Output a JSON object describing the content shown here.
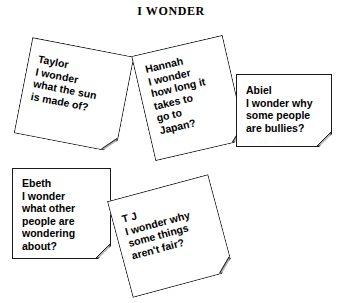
{
  "page": {
    "title": "I WONDER",
    "background_color": "#ffffff",
    "ink_color": "#000000",
    "note_border_color": "#1a1a1a",
    "fold_fill_color": "#b3b3b3"
  },
  "notes": [
    {
      "id": "taylor",
      "author": "Taylor",
      "lines": [
        "Taylor",
        "I wonder",
        "what the sun",
        "is made of?"
      ],
      "line_1": "Taylor",
      "line_2": "I wonder",
      "line_3": "what the sun",
      "line_4": "is made of?",
      "rotation_deg": 11
    },
    {
      "id": "hannah",
      "author": "Hannah",
      "lines": [
        "Hannah",
        "I wonder",
        "how long it",
        "takes to",
        "go to",
        "Japan?"
      ],
      "line_1": "Hannah",
      "line_2": "I wonder",
      "line_3": "how long it",
      "line_4": "takes to",
      "line_5": "go to",
      "line_6": "Japan?",
      "rotation_deg": -13
    },
    {
      "id": "abiel",
      "author": "Abiel",
      "lines": [
        "Abiel",
        "I wonder why",
        "some people",
        "are bullies?"
      ],
      "line_1": "Abiel",
      "line_2": "I wonder why",
      "line_3": "some people",
      "line_4": "are bullies?",
      "rotation_deg": 0
    },
    {
      "id": "ebeth",
      "author": "Ebeth",
      "lines": [
        "Ebeth",
        "I wonder",
        "what other",
        "people are",
        "wondering",
        "about?"
      ],
      "line_1": "Ebeth",
      "line_2": "I wonder",
      "line_3": "what other",
      "line_4": "people are",
      "line_5": "wondering",
      "line_6": "about?",
      "rotation_deg": 0
    },
    {
      "id": "tj",
      "author": "T J",
      "lines": [
        "T J",
        "I wonder why",
        "some things",
        "aren't fair?"
      ],
      "line_1": "T J",
      "line_2": "I wonder why",
      "line_3": "some things",
      "line_4": "aren't fair?",
      "rotation_deg": -15
    }
  ]
}
